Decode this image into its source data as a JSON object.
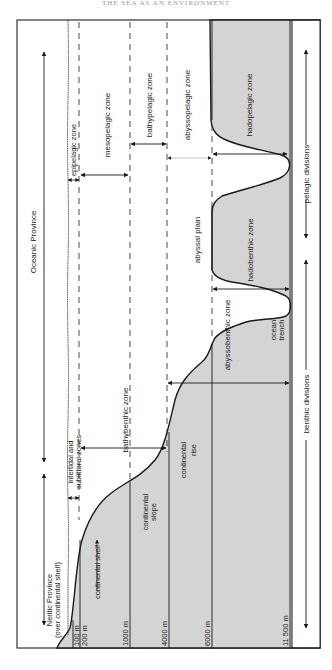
{
  "header": {
    "title": "THE SEA AS AN ENVIRONMENT"
  },
  "colors": {
    "seafloor_fill": "#d4d4d4",
    "line": "#1a1a1a",
    "background": "#ffffff",
    "frame": "#333333"
  },
  "provinces": {
    "oceanic": "Oceanic Province",
    "neritic_line1": "Neritic Province",
    "neritic_line2": "(over continental shelf)"
  },
  "pelagic_zones": {
    "epipelagic": "epipelagic zone",
    "mesopelagic": "mesopelagic zone",
    "bathypelagic": "bathypelagic zone",
    "abyssopelagic": "abyssopelagic zone",
    "hadopelagic": "hadopelagic zone"
  },
  "benthic_zones": {
    "intertidal_line1": "intertidal and",
    "intertidal_line2": "sublittoral zones",
    "bathybenthic": "bathybenthic zone",
    "abyssobenthic": "abyssobenthic zone",
    "hadobenthic": "hadobenthic zone"
  },
  "features": {
    "continental_shelf": "continental shelf",
    "continental_slope_line1": "continental",
    "continental_slope_line2": "slope",
    "continental_rise_line1": "continental",
    "continental_rise_line2": "rise",
    "abyssal_plain": "abyssal plain",
    "ocean_trench_line1": "ocean",
    "ocean_trench_line2": "trench"
  },
  "divisions": {
    "pelagic": "pelagic divisions",
    "benthic": "benthic divisions"
  },
  "depths": [
    "100 m",
    "200 m",
    "1000 m",
    "4000 m",
    "6000 m",
    "11 500 m"
  ]
}
